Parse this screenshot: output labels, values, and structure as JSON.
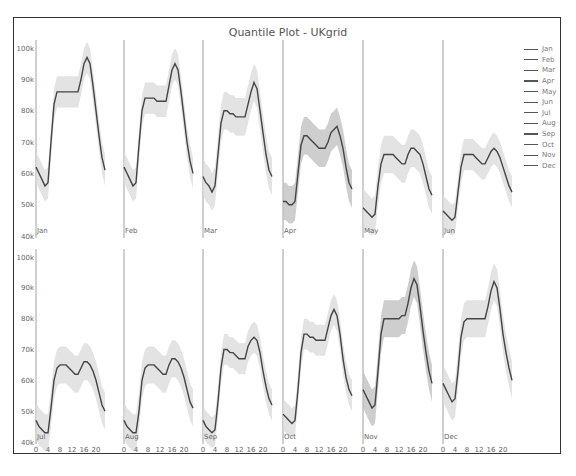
{
  "title": "Quantile Plot - UKgrid",
  "legend": [
    "Jan",
    "Feb",
    "Mar",
    "Apr",
    "May",
    "Jun",
    "Jul",
    "Aug",
    "Sep",
    "Oct",
    "Nov",
    "Dec"
  ],
  "colors": {
    "median_line": "#444444",
    "band_fill": "#d9d9d9",
    "band_fill_dark": "#bdbdbd",
    "axis": "#888888",
    "frame": "#333333",
    "text": "#666666"
  },
  "chart_data": {
    "type": "line",
    "title": "Quantile Plot - UKgrid",
    "xlabel": "",
    "ylabel": "",
    "layout": "2x6 facet grid by month, median line with quantile band",
    "x_ticks": [
      0,
      4,
      8,
      12,
      16,
      20
    ],
    "y_ticks": [
      "40k",
      "50k",
      "60k",
      "70k",
      "80k",
      "90k",
      "100k"
    ],
    "ylim": [
      40000,
      100000
    ],
    "grid": false,
    "legend_position": "right",
    "x": [
      0,
      1,
      2,
      3,
      4,
      5,
      6,
      7,
      8,
      9,
      10,
      11,
      12,
      13,
      14,
      15,
      16,
      17,
      18,
      19,
      20,
      21,
      22,
      23
    ],
    "panels": [
      {
        "name": "Jan",
        "median": [
          62,
          60,
          58,
          56,
          57,
          70,
          82,
          86,
          86,
          86,
          86,
          86,
          86,
          86,
          86,
          90,
          95,
          97,
          95,
          88,
          80,
          72,
          65,
          61
        ],
        "band": 5
      },
      {
        "name": "Feb",
        "median": [
          62,
          60,
          58,
          56,
          57,
          69,
          80,
          84,
          84,
          84,
          84,
          83,
          83,
          83,
          83,
          88,
          93,
          95,
          93,
          86,
          78,
          70,
          64,
          60
        ],
        "band": 5
      },
      {
        "name": "Mar",
        "median": [
          59,
          57,
          56,
          54,
          56,
          66,
          76,
          80,
          80,
          79,
          79,
          78,
          78,
          78,
          78,
          82,
          86,
          89,
          87,
          80,
          73,
          66,
          61,
          59
        ],
        "band": 6
      },
      {
        "name": "Apr",
        "median": [
          51,
          51,
          50,
          50,
          51,
          60,
          69,
          72,
          72,
          71,
          70,
          69,
          68,
          68,
          68,
          70,
          73,
          74,
          75,
          72,
          68,
          62,
          57,
          55
        ],
        "band": 6
      },
      {
        "name": "May",
        "median": [
          49,
          48,
          47,
          46,
          47,
          56,
          63,
          66,
          66,
          66,
          66,
          65,
          64,
          63,
          63,
          66,
          68,
          68,
          67,
          66,
          63,
          59,
          55,
          53
        ],
        "band": 6
      },
      {
        "name": "Jun",
        "median": [
          48,
          47,
          46,
          45,
          46,
          54,
          62,
          66,
          66,
          66,
          66,
          65,
          64,
          63,
          63,
          65,
          67,
          68,
          67,
          65,
          62,
          59,
          56,
          54
        ],
        "band": 5
      },
      {
        "name": "Jul",
        "median": [
          47,
          45,
          44,
          43,
          43,
          51,
          60,
          64,
          65,
          65,
          65,
          64,
          63,
          62,
          62,
          64,
          66,
          66,
          65,
          63,
          60,
          56,
          52,
          50
        ],
        "band": 6
      },
      {
        "name": "Aug",
        "median": [
          47,
          45,
          44,
          43,
          43,
          50,
          60,
          64,
          65,
          65,
          65,
          64,
          63,
          62,
          62,
          65,
          67,
          67,
          66,
          64,
          61,
          57,
          53,
          51
        ],
        "band": 6
      },
      {
        "name": "Sep",
        "median": [
          47,
          45,
          44,
          43,
          44,
          53,
          64,
          70,
          70,
          69,
          69,
          68,
          67,
          67,
          67,
          71,
          73,
          74,
          73,
          69,
          63,
          58,
          54,
          52
        ],
        "band": 5
      },
      {
        "name": "Oct",
        "median": [
          49,
          48,
          47,
          46,
          47,
          57,
          69,
          75,
          75,
          74,
          74,
          73,
          73,
          73,
          73,
          77,
          81,
          83,
          81,
          75,
          67,
          61,
          57,
          55
        ],
        "band": 5
      },
      {
        "name": "Nov",
        "median": [
          57,
          55,
          53,
          51,
          52,
          63,
          75,
          80,
          80,
          80,
          80,
          80,
          80,
          81,
          81,
          85,
          90,
          93,
          91,
          84,
          76,
          69,
          63,
          59
        ],
        "band": 6
      },
      {
        "name": "Dec",
        "median": [
          59,
          57,
          55,
          53,
          54,
          63,
          74,
          79,
          80,
          80,
          80,
          80,
          80,
          80,
          80,
          84,
          89,
          92,
          90,
          83,
          75,
          69,
          64,
          60
        ],
        "band": 6
      }
    ]
  }
}
